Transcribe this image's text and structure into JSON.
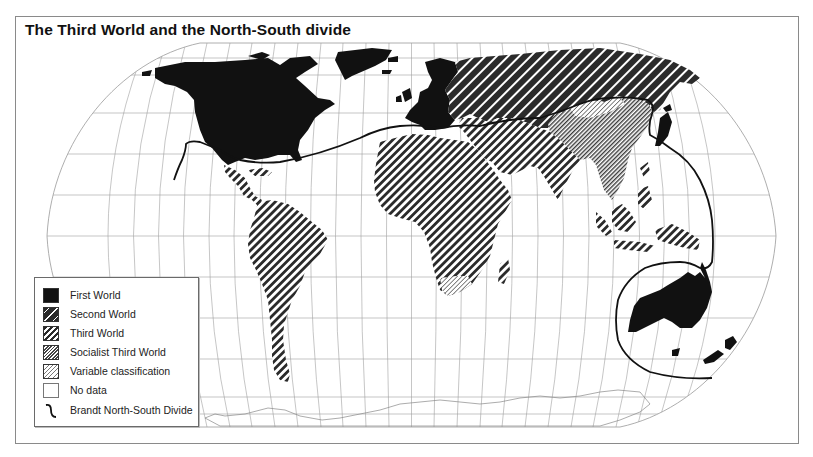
{
  "title": "The Third World and the North-South divide",
  "legend": {
    "items": [
      {
        "key": "first-world",
        "label": "First World",
        "pattern": "solid-black"
      },
      {
        "key": "second-world",
        "label": "Second World",
        "pattern": "wide-dark-hatch"
      },
      {
        "key": "third-world",
        "label": "Third World",
        "pattern": "bold-hatch"
      },
      {
        "key": "socialist-third-world",
        "label": "Socialist Third World",
        "pattern": "fine-dark-hatch"
      },
      {
        "key": "variable-classification",
        "label": "Variable classification",
        "pattern": "fine-light-hatch"
      },
      {
        "key": "no-data",
        "label": "No data",
        "pattern": "blank"
      },
      {
        "key": "brandt-line",
        "label": "Brandt North-South Divide",
        "pattern": "line"
      }
    ]
  },
  "map": {
    "projection": "Robinson-like pseudocylindrical",
    "regions": {
      "first_world": [
        "North America (USA, Canada)",
        "Greenland",
        "Western Europe",
        "Japan",
        "Australia",
        "New Zealand"
      ],
      "second_world": [
        "USSR",
        "Eastern Europe"
      ],
      "third_world": [
        "Latin America",
        "Africa",
        "Middle East",
        "South Asia",
        "Southeast Asia"
      ],
      "socialist_third_world": [
        "China",
        "Mongolia",
        "Indochina"
      ],
      "variable_classification": [
        "South Africa",
        "parts of East Asia"
      ]
    },
    "colors": {
      "ink": "#111111",
      "graticule": "#9a9a9a",
      "background": "#ffffff"
    }
  }
}
